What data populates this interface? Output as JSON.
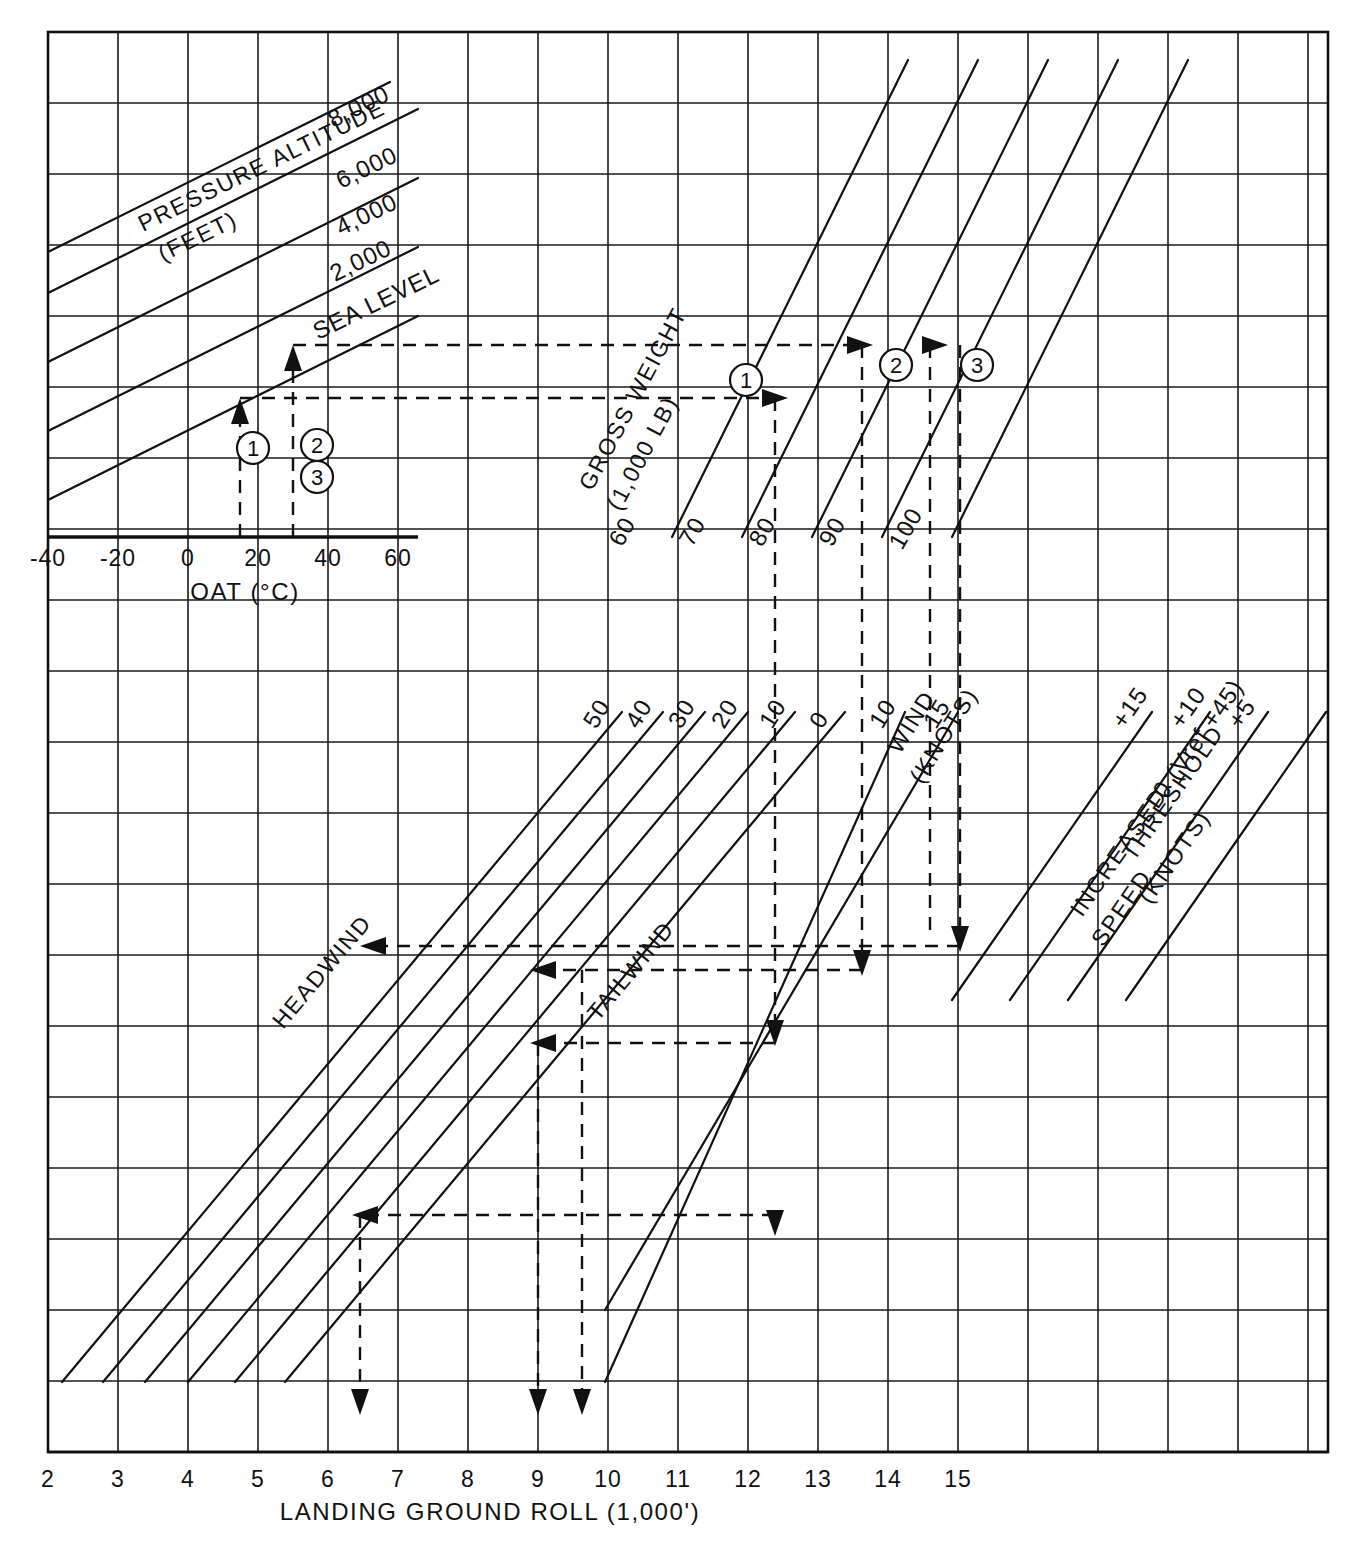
{
  "chart_data": {
    "type": "line",
    "panels": [
      {
        "name": "oat-pressure-altitude",
        "xlabel": "OAT (°C)",
        "xticks": [
          "-40",
          "-20",
          "0",
          "20",
          "40",
          "60"
        ],
        "family_label_line1": "PRESSURE ALTITUDE",
        "family_label_line2": "(FEET)",
        "curves": [
          "8,000",
          "6,000",
          "4,000",
          "2,000",
          "SEA LEVEL"
        ]
      },
      {
        "name": "gross-weight",
        "family_label_line1": "GROSS WEIGHT",
        "family_label_line2": "(1,000 LB)",
        "curves": [
          "60",
          "70",
          "80",
          "90",
          "100"
        ]
      },
      {
        "name": "wind",
        "family_label_line1": "WIND",
        "family_label_line2": "(KNOTS)",
        "headwind_label": "HEADWIND",
        "tailwind_label": "TAILWIND",
        "curves": [
          "50",
          "40",
          "30",
          "20",
          "10",
          "0",
          "10",
          "15"
        ]
      },
      {
        "name": "increased-threshold-speed",
        "family_label_line1": "INCREASED",
        "family_label_line2": "SPEED",
        "family_label_line3": "THRESHOLD",
        "family_label_line4": "(KNOTS)",
        "curves": [
          "+15",
          "+10",
          "+5",
          "0  (Vref +45)"
        ]
      }
    ],
    "xlabel": "LANDING GROUND ROLL (1,000')",
    "xticks": [
      "2",
      "3",
      "4",
      "5",
      "6",
      "7",
      "8",
      "9",
      "10",
      "11",
      "12",
      "13",
      "14",
      "15"
    ],
    "steps": [
      "1",
      "2",
      "3"
    ],
    "example_paths": [
      {
        "step": "1",
        "oat_c": 15,
        "pressure_altitude": "SEA LEVEL",
        "gross_weight": 90,
        "wind": "10 headwind",
        "threshold_speed": "0 (Vref +45)",
        "ground_roll": 9.0
      },
      {
        "step": "2",
        "oat_c": 30,
        "pressure_altitude": "SEA LEVEL",
        "gross_weight": 100,
        "wind": "0",
        "threshold_speed": "+5",
        "ground_roll": 9.5
      },
      {
        "step": "3",
        "oat_c": 30,
        "pressure_altitude": "SEA LEVEL",
        "gross_weight": 100,
        "wind": "15 tailwind",
        "threshold_speed": "+15",
        "ground_roll": 6.3
      }
    ],
    "grid": true,
    "legend": "none"
  }
}
